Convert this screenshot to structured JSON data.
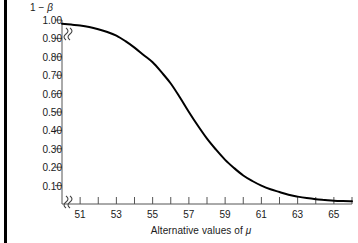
{
  "chart_data": {
    "type": "line",
    "title": "",
    "subtitle": "",
    "ylabel": "1 − β",
    "xlabel": "Alternative values of μ",
    "xlim": [
      50,
      66
    ],
    "ylim": [
      0,
      1.0
    ],
    "grid": false,
    "legend": null,
    "axis_break_x": true,
    "axis_break_y": true,
    "y_ticks": [
      0.1,
      0.2,
      0.3,
      0.4,
      0.5,
      0.6,
      0.7,
      0.8,
      0.9,
      1.0
    ],
    "y_tick_labels": [
      "0.10",
      "0.20",
      "0.30",
      "0.40",
      "0.50",
      "0.60",
      "0.70",
      "0.80",
      "0.90",
      "1.00"
    ],
    "x_ticks": [
      50,
      51,
      52,
      53,
      54,
      55,
      56,
      57,
      58,
      59,
      60,
      61,
      62,
      63,
      64,
      65,
      66
    ],
    "x_tick_labels_shown": [
      "51",
      "53",
      "55",
      "57",
      "59",
      "61",
      "63",
      "65"
    ],
    "line_color": "#000000",
    "series": [
      {
        "name": "power",
        "x": [
          50.0,
          50.5,
          51.0,
          51.5,
          52.0,
          52.5,
          53.0,
          53.5,
          54.0,
          54.5,
          55.0,
          55.5,
          56.0,
          56.5,
          57.0,
          57.5,
          58.0,
          58.5,
          59.0,
          59.5,
          60.0,
          60.5,
          61.0,
          61.5,
          62.0,
          62.5,
          63.0,
          63.5,
          64.0,
          64.5,
          65.0,
          65.5,
          66.0
        ],
        "values": [
          0.98,
          0.975,
          0.97,
          0.962,
          0.95,
          0.935,
          0.915,
          0.885,
          0.85,
          0.81,
          0.77,
          0.715,
          0.655,
          0.58,
          0.5,
          0.425,
          0.355,
          0.295,
          0.24,
          0.195,
          0.155,
          0.125,
          0.1,
          0.08,
          0.065,
          0.05,
          0.04,
          0.032,
          0.026,
          0.022,
          0.018,
          0.016,
          0.015
        ]
      }
    ]
  },
  "labels": {
    "y_axis_title_prefix": "1 − ",
    "y_axis_title_symbol": "β",
    "x_axis_title_prefix": "Alternative values of ",
    "x_axis_title_symbol": "μ"
  }
}
